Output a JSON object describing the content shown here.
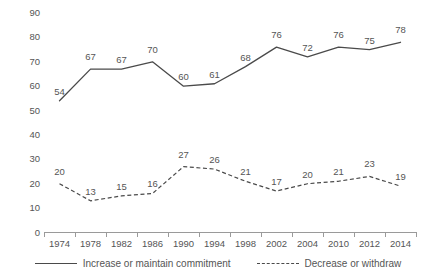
{
  "chart_data": {
    "type": "line",
    "title": "",
    "subtitle": "",
    "xlabel": "",
    "ylabel": "",
    "ylim": [
      0,
      90
    ],
    "ytick_step": 10,
    "yticks": [
      90,
      80,
      70,
      60,
      50,
      40,
      30,
      20,
      10,
      0
    ],
    "grid": false,
    "legend_position": "bottom-center",
    "categories": [
      "1974",
      "1978",
      "1982",
      "1986",
      "1990",
      "1994",
      "1998",
      "2002",
      "2004",
      "2010",
      "2012",
      "2014"
    ],
    "series": [
      {
        "name": "Increase or maintain commitment",
        "style": "solid",
        "color": "#4a4a4a",
        "values": [
          54,
          67,
          67,
          70,
          60,
          61,
          68,
          76,
          72,
          76,
          75,
          78
        ]
      },
      {
        "name": "Decrease or withdraw",
        "style": "dashed",
        "color": "#4a4a4a",
        "values": [
          20,
          13,
          15,
          16,
          27,
          26,
          21,
          17,
          20,
          21,
          23,
          19
        ]
      }
    ]
  },
  "legend": {
    "items": [
      {
        "label": "Increase or maintain commitment",
        "style": "solid"
      },
      {
        "label": "Decrease or withdraw",
        "style": "dashed"
      }
    ]
  },
  "colors": {
    "line": "#4a4a4a",
    "axis": "#9a9a9a",
    "text": "#555555",
    "background": "#ffffff"
  }
}
